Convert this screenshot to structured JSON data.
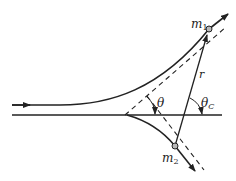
{
  "diagram": {
    "labels": {
      "m1": "m",
      "m1_sub": "1",
      "m2": "m",
      "m2_sub": "2",
      "r": "r",
      "theta": "θ",
      "theta_c": "θ",
      "theta_c_sub": "C"
    },
    "colors": {
      "stroke": "#222222",
      "particle_fill": "#b8b8b8"
    }
  }
}
